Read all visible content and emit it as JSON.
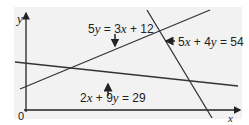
{
  "axes": {
    "x_label": "x",
    "y_label": "y",
    "origin_label": "0"
  },
  "lines": [
    {
      "equation": "5y = 3x + 12",
      "label_parts": [
        "5",
        "y",
        " = 3",
        "x",
        " + 12"
      ]
    },
    {
      "equation": "5x + 4y = 54",
      "label_parts": [
        "5",
        "x",
        " + 4",
        "y",
        " = 54"
      ]
    },
    {
      "equation": "2x + 9y = 29",
      "label_parts": [
        "2",
        "x",
        " + 9",
        "y",
        " = 29"
      ]
    }
  ],
  "colors": {
    "line": "#333333",
    "panel": "#f2f2f2"
  }
}
